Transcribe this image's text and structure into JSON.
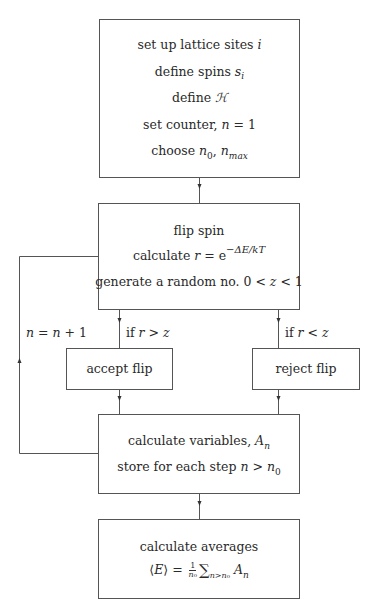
{
  "diagram": {
    "type": "flowchart",
    "colors": {
      "stroke": "#555555",
      "text": "#2a2a2a",
      "background": "#ffffff"
    },
    "nodes": {
      "init": {
        "lines": [
          {
            "text": "set up lattice sites ",
            "var": "i"
          },
          {
            "text": "define spins ",
            "var": "s",
            "sub": "i"
          },
          {
            "text": "define ",
            "var": "ℋ"
          },
          {
            "text": "set counter, ",
            "var": "n",
            "rest": " = 1"
          },
          {
            "text": "choose ",
            "var": "n",
            "sub": "0",
            "rest2_var": "n",
            "rest2_sub": "max"
          }
        ]
      },
      "flip": {
        "lines": [
          {
            "text": "flip spin"
          },
          {
            "text": "calculate ",
            "var": "r",
            "rest": " = e",
            "sup": "−ΔE/kT"
          },
          {
            "text": "generate a random no. 0 < ",
            "var": "z",
            "rest": " < 1"
          }
        ]
      },
      "accept": {
        "label": "accept flip"
      },
      "reject": {
        "label": "reject flip"
      },
      "calc": {
        "lines": [
          {
            "text": "calculate variables, ",
            "var": "A",
            "sub": "n"
          },
          {
            "text": "store for each step ",
            "var": "n",
            "rest": " > ",
            "var2": "n",
            "sub2": "0"
          }
        ]
      },
      "averages": {
        "lines": [
          {
            "text": "calculate averages"
          },
          {
            "formula": "⟨E⟩ = (1/n0) Σ_{n>n0} A_n"
          }
        ]
      }
    },
    "edge_labels": {
      "accept_condition": {
        "prefix": "if ",
        "var1": "r",
        "op": " > ",
        "var2": "z"
      },
      "reject_condition": {
        "prefix": "if ",
        "var1": "r",
        "op": " < ",
        "var2": "z"
      },
      "loop_increment": {
        "var1": "n",
        "op": " = ",
        "var2": "n",
        "rest": " + 1"
      }
    },
    "edges": [
      {
        "from": "init",
        "to": "flip"
      },
      {
        "from": "flip",
        "to": "accept",
        "label": "if r > z"
      },
      {
        "from": "flip",
        "to": "reject",
        "label": "if r < z"
      },
      {
        "from": "accept",
        "to": "calc"
      },
      {
        "from": "reject",
        "to": "calc"
      },
      {
        "from": "calc",
        "to": "flip",
        "label": "n = n + 1"
      },
      {
        "from": "calc",
        "to": "averages"
      }
    ]
  }
}
